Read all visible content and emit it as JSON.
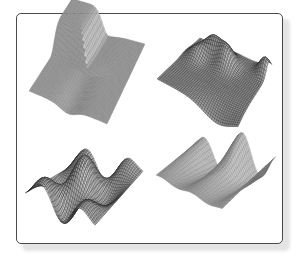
{
  "figure": {
    "colors": {
      "background": "#ffffff",
      "frame_border": "#4a4a4a",
      "frame_shadow": "#e4e4e4",
      "wire_light": "#7a7a7a",
      "wire_dark": "#2a2a2a"
    },
    "panels": [
      {
        "id": "top-left",
        "surface": "saddle-cross-ridge",
        "corners": [
          [
            29,
            91
          ],
          [
            72,
            24
          ],
          [
            145,
            44
          ],
          [
            107,
            124
          ]
        ],
        "height_scale": 28,
        "grid": 34,
        "style": "mesh"
      },
      {
        "id": "top-right",
        "surface": "sheet-with-peaks",
        "corners": [
          [
            157,
            79
          ],
          [
            200,
            38
          ],
          [
            272,
            69
          ],
          [
            238,
            122
          ]
        ],
        "height_scale": 22,
        "grid": 40,
        "style": "dense"
      },
      {
        "id": "bottom-left",
        "surface": "oscillating-ridges",
        "corners": [
          [
            25,
            188
          ],
          [
            70,
            162
          ],
          [
            143,
            166
          ],
          [
            95,
            220
          ]
        ],
        "height_scale": 26,
        "grid": 40,
        "style": "dense"
      },
      {
        "id": "bottom-right",
        "surface": "sine-waves",
        "corners": [
          [
            156,
            176
          ],
          [
            198,
            150
          ],
          [
            276,
            170
          ],
          [
            222,
            210
          ]
        ],
        "height_scale": 26,
        "grid": 36,
        "style": "mesh"
      }
    ]
  }
}
